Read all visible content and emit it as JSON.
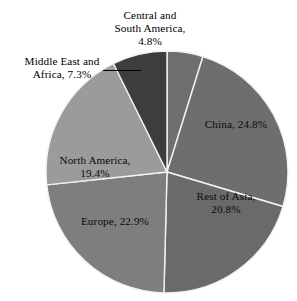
{
  "chart_data": {
    "type": "pie",
    "title": "",
    "subtitle": "",
    "xlabel": "",
    "ylabel": "",
    "legend_position": "none",
    "grid": false,
    "units": "percent",
    "total": 100.0,
    "start_angle_deg": 0,
    "direction": "clockwise",
    "categories": [
      "Central and South America",
      "China",
      "Rest of Asia",
      "Europe",
      "North America",
      "Middle East and Africa"
    ],
    "values": [
      4.8,
      24.8,
      20.8,
      22.9,
      19.4,
      7.3
    ],
    "slices": [
      {
        "name": "Central and South America",
        "value": 4.8,
        "value_text": "4.8%",
        "label_text": "Central and\nSouth America,\n4.8%",
        "label_placement": "outside-top",
        "color": "#6f6f6f",
        "has_leader_line": false
      },
      {
        "name": "China",
        "value": 24.8,
        "value_text": "24.8%",
        "label_text": "China, 24.8%",
        "label_placement": "inside",
        "color": "#6e6e6e",
        "has_leader_line": false
      },
      {
        "name": "Rest of Asia",
        "value": 20.8,
        "value_text": "20.8%",
        "label_text": "Rest of Asia,\n20.8%",
        "label_placement": "inside",
        "color": "#6a6a6a",
        "has_leader_line": false
      },
      {
        "name": "Europe",
        "value": 22.9,
        "value_text": "22.9%",
        "label_text": "Europe, 22.9%",
        "label_placement": "inside",
        "color": "#7e7e7e",
        "has_leader_line": false
      },
      {
        "name": "North America",
        "value": 19.4,
        "value_text": "19.4%",
        "label_text": "North America,\n19.4%",
        "label_placement": "inside",
        "color": "#9b9b9b",
        "has_leader_line": false
      },
      {
        "name": "Middle East and Africa",
        "value": 7.3,
        "value_text": "7.3%",
        "label_text": "Middle East and\nAfrica, 7.3%",
        "label_placement": "outside-left",
        "color": "#3d3d3d",
        "has_leader_line": true
      }
    ],
    "geometry": {
      "center_x": 167,
      "center_y": 172,
      "radius": 121,
      "separator_color": "#f2f2f2",
      "separator_width": 1.4,
      "background": "#ffffff"
    }
  }
}
